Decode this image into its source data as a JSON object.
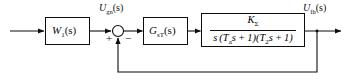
{
  "diagram": {
    "type": "control-system-block-diagram",
    "stroke_color": "#0d0d0d",
    "background_color": "#ffffff"
  },
  "blocks": [
    {
      "id": "prefilter",
      "name": "W1",
      "label_main": "W",
      "label_sub": "1",
      "label_arg": "(s)",
      "x": 45,
      "y": 17,
      "width": 45,
      "height": 28
    },
    {
      "id": "controller",
      "name": "GsT",
      "label_main": "G",
      "label_sub": "sT",
      "label_arg": "(s)",
      "x": 143,
      "y": 17,
      "width": 45,
      "height": 28
    },
    {
      "id": "plant",
      "name": "plant-transfer-function",
      "x": 201,
      "y": 13,
      "width": 104,
      "height": 34,
      "numerator": {
        "main": "K",
        "sub": "Σ"
      },
      "denominator": {
        "text_lead": "s (T",
        "sub1": "a",
        "text_mid": "s + 1)(T",
        "sub2": "2",
        "text_tail": "s + 1)"
      }
    }
  ],
  "summing_junction": {
    "name": "summing-junction",
    "cx": 118,
    "cy": 31,
    "r": 5.5,
    "signs": [
      {
        "label": "+",
        "input": "forward",
        "x": 107,
        "y": 34
      },
      {
        "label": "−",
        "input": "feedback",
        "x": 125,
        "y": 34
      }
    ]
  },
  "signals": [
    {
      "id": "sum-output",
      "name": "error-signal-label",
      "main": "U",
      "sub": "gn",
      "arg": "(s)",
      "x": 99,
      "y": 3
    },
    {
      "id": "plant-output",
      "name": "output-signal-label",
      "main": "U",
      "sub": "fh",
      "arg": "(s)",
      "x": 303,
      "y": 3
    }
  ],
  "wires": {
    "input_arrow": {
      "from_x": 10,
      "to_x": 45,
      "y": 31
    },
    "prefilter_to_sum": {
      "from_x": 90,
      "to_x": 112,
      "y": 31
    },
    "sum_to_controller": {
      "from_x": 124,
      "to_x": 143,
      "y": 31
    },
    "controller_to_plant": {
      "from_x": 188,
      "to_x": 201,
      "y": 31
    },
    "plant_to_output": {
      "from_x": 305,
      "to_x": 341,
      "y": 31
    },
    "feedback_branch_x": 317,
    "feedback_bottom_y": 72,
    "feedback_return_x": 118,
    "feedback_up_to_y": 37
  }
}
